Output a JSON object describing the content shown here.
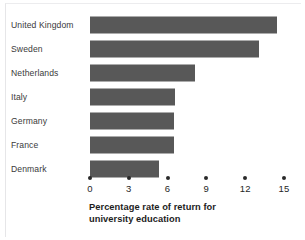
{
  "chart_data": {
    "type": "bar",
    "orientation": "horizontal",
    "title": "",
    "xlabel": "Percentage rate of return for university education",
    "ylabel": "",
    "categories": [
      "United Kingdom",
      "Sweden",
      "Netherlands",
      "Italy",
      "Germany",
      "France",
      "Denmark"
    ],
    "values": [
      14.5,
      13.1,
      8.1,
      6.6,
      6.5,
      6.5,
      5.3
    ],
    "xlim": [
      0,
      15
    ],
    "xticks": [
      0,
      3,
      6,
      9,
      12,
      15
    ],
    "xtick_labels": [
      "0",
      "3",
      "6",
      "9",
      "12",
      "15"
    ],
    "grid": false,
    "legend": null,
    "bar_color": "#585858",
    "background_color": "#ffffff",
    "axis_color": "#2a2a2a"
  },
  "axis_title": {
    "line1": "Percentage rate of return for",
    "line2": "university education"
  }
}
